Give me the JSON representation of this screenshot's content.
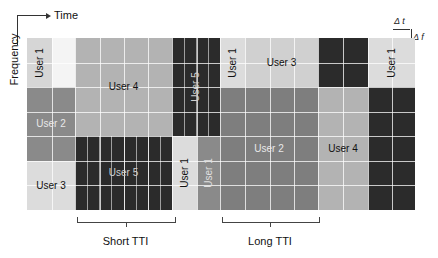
{
  "axes": {
    "time_label": "Time",
    "frequency_label": "Frequency",
    "delta_t_label": "Δ t",
    "delta_f_label": "Δ f"
  },
  "colors": {
    "light": "#d6d6d6",
    "lighter": "#e2e2e2",
    "user4": "#b3b3b3",
    "medium": "#8a8a8a",
    "user2": "#7e7e7e",
    "dark": "#2b2b2b",
    "blank": "#ffffff"
  },
  "grid": {
    "x_start": 27,
    "x_end": 415,
    "y_start": 38,
    "y_end": 210,
    "rows": 7
  },
  "blocks": [
    {
      "name": "user1-block-a",
      "label": "User 1",
      "x": 27,
      "y": 38,
      "w": 25,
      "h": 49,
      "color": "#d6d6d6",
      "text": "#111",
      "rotate": true
    },
    {
      "name": "blank-block",
      "label": "",
      "x": 52,
      "y": 38,
      "w": 23,
      "h": 49,
      "color": "#f4f4f4",
      "text": "#111",
      "rotate": false
    },
    {
      "name": "user2-block-left",
      "label": "User 2",
      "x": 27,
      "y": 87,
      "w": 48,
      "h": 74,
      "color": "#8a8a8a",
      "text": "#e8e8e8",
      "rotate": false
    },
    {
      "name": "user3-block-left",
      "label": "User 3",
      "x": 27,
      "y": 161,
      "w": 48,
      "h": 49,
      "color": "#dcdcdc",
      "text": "#111",
      "rotate": false
    },
    {
      "name": "user4-block-left",
      "label": "User 4",
      "x": 75,
      "y": 38,
      "w": 97,
      "h": 98,
      "color": "#b3b3b3",
      "text": "#111",
      "rotate": false
    },
    {
      "name": "user5-block-left",
      "label": "User 5",
      "x": 75,
      "y": 136,
      "w": 97,
      "h": 74,
      "color": "#2b2b2b",
      "text": "#d0d0d0",
      "rotate": false
    },
    {
      "name": "user5-block-mid",
      "label": "User 5",
      "x": 172,
      "y": 38,
      "w": 48,
      "h": 98,
      "color": "#2b2b2b",
      "text": "#d0d0d0",
      "rotate": true
    },
    {
      "name": "user1-block-mid-light",
      "label": "User 1",
      "x": 172,
      "y": 136,
      "w": 25,
      "h": 74,
      "color": "#dcdcdc",
      "text": "#111",
      "rotate": true
    },
    {
      "name": "user1-block-mid-medium",
      "label": "User 1",
      "x": 197,
      "y": 136,
      "w": 23,
      "h": 74,
      "color": "#8a8a8a",
      "text": "#e0e0e0",
      "rotate": true
    },
    {
      "name": "user1-block-b",
      "label": "User 1",
      "x": 220,
      "y": 38,
      "w": 25,
      "h": 49,
      "color": "#dcdcdc",
      "text": "#111",
      "rotate": true
    },
    {
      "name": "user3-block-top",
      "label": "User 3",
      "x": 245,
      "y": 38,
      "w": 73,
      "h": 49,
      "color": "#d0d0d0",
      "text": "#111",
      "rotate": false
    },
    {
      "name": "user2-block-main",
      "label": "User 2",
      "x": 220,
      "y": 87,
      "w": 98,
      "h": 123,
      "color": "#7e7e7e",
      "text": "#e8e8e8",
      "rotate": false
    },
    {
      "name": "dark-block-top-right",
      "label": "",
      "x": 318,
      "y": 38,
      "w": 50,
      "h": 49,
      "color": "#2b2b2b",
      "text": "#d0d0d0",
      "rotate": false
    },
    {
      "name": "user4-block-right",
      "label": "User 4",
      "x": 318,
      "y": 87,
      "w": 50,
      "h": 123,
      "color": "#b3b3b3",
      "text": "#111",
      "rotate": false
    },
    {
      "name": "user1-block-c",
      "label": "User 1",
      "x": 368,
      "y": 38,
      "w": 47,
      "h": 49,
      "color": "#dcdcdc",
      "text": "#111",
      "rotate": true
    },
    {
      "name": "dark-block-right",
      "label": "",
      "x": 368,
      "y": 87,
      "w": 47,
      "h": 123,
      "color": "#2b2b2b",
      "text": "#d0d0d0",
      "rotate": false
    }
  ],
  "braces": [
    {
      "name": "short-tti-brace",
      "label": "Short TTI",
      "x1": 77,
      "x2": 174
    },
    {
      "name": "long-tti-brace",
      "label": "Long TTI",
      "x1": 222,
      "x2": 318
    }
  ]
}
